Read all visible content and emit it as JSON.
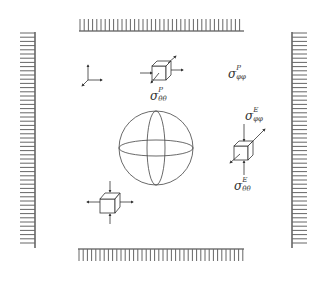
{
  "figure": {
    "stroke_color": "#333333",
    "hatch_color": "#666666",
    "background": "#ffffff"
  },
  "labels": {
    "top_cube": {
      "symbol": "σ",
      "superscript": "P",
      "subscript": "θθ"
    },
    "upper_right": {
      "symbol": "σ",
      "superscript": "P",
      "subscript": "φφ"
    },
    "right_cube_top": {
      "symbol": "σ",
      "superscript": "E",
      "subscript": "φφ"
    },
    "right_cube_bottom": {
      "symbol": "σ",
      "superscript": "E",
      "subscript": "θθ"
    }
  },
  "elements": {
    "boundary_loads": [
      "top",
      "bottom",
      "left",
      "right"
    ],
    "coordinate_axes": "3D axes triad",
    "sphere": "central sphere with equator and meridian",
    "stress_cubes": [
      "top",
      "right",
      "bottom-left"
    ]
  }
}
